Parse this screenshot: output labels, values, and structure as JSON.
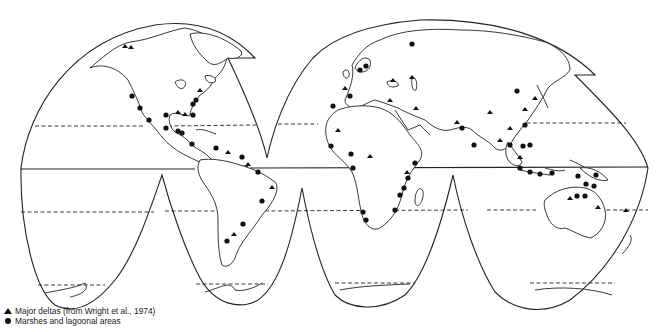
{
  "map": {
    "projection": "interrupted-homolosine",
    "colors": {
      "ink": "#222222",
      "background": "#ffffff"
    },
    "parallels": [
      {
        "name": "tropic-of-cancer",
        "style": "dashed"
      },
      {
        "name": "equator",
        "style": "solid"
      },
      {
        "name": "tropic-of-capricorn",
        "style": "dashed"
      },
      {
        "name": "antarctic-circle",
        "style": "dashed"
      }
    ],
    "marker_counts": {
      "deltas": 38,
      "marshes": 62
    }
  },
  "legend": {
    "items": [
      {
        "symbol": "triangle-icon",
        "label": "Major deltas (from Wright et al., 1974)"
      },
      {
        "symbol": "dot-icon",
        "label": "Marshes and lagoonal areas"
      }
    ]
  }
}
